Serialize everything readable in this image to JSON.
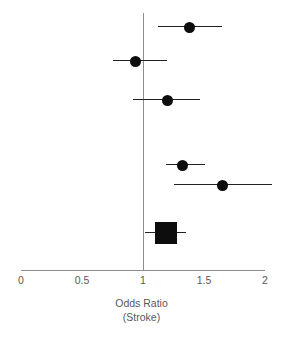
{
  "chart_data": {
    "type": "forest",
    "title": "",
    "xlabel": "Odds Ratio",
    "xlabel_sub": "(Stroke)",
    "ylabel": "",
    "xlim": [
      0,
      2
    ],
    "xticks": [
      0,
      0.5,
      1,
      1.5,
      2
    ],
    "xtick_labels": [
      "0",
      "0.5",
      "1",
      "1.5",
      "2"
    ],
    "null_line": 1,
    "grid": false,
    "legend": "none",
    "marker_color": "#0d0d0d",
    "line_color": "#222222",
    "axis_color": "#8d8d8d",
    "clipped_right": true,
    "studies": [
      {
        "id": "study-1",
        "label": "",
        "estimate": 1.38,
        "ci_low": 1.12,
        "ci_high": 1.65,
        "marker": "circle",
        "marker_size": 11,
        "significant": true
      },
      {
        "id": "study-2",
        "label": "",
        "estimate": 0.94,
        "ci_low": 0.75,
        "ci_high": 1.2,
        "marker": "circle",
        "marker_size": 11,
        "significant": false
      },
      {
        "id": "study-3",
        "label": "",
        "estimate": 1.2,
        "ci_low": 0.92,
        "ci_high": 1.47,
        "marker": "circle",
        "marker_size": 11,
        "significant": false
      },
      {
        "id": "study-4",
        "label": "",
        "estimate": 1.32,
        "ci_low": 1.19,
        "ci_high": 1.51,
        "marker": "circle",
        "marker_size": 11,
        "significant": true
      },
      {
        "id": "study-5",
        "label": "",
        "estimate": 1.65,
        "ci_low": 1.25,
        "ci_high": 2.06,
        "marker": "circle",
        "marker_size": 11,
        "significant": true
      },
      {
        "id": "summary",
        "label": "",
        "estimate": 1.19,
        "ci_low": 1.02,
        "ci_high": 1.35,
        "marker": "square",
        "marker_size": 22,
        "significant": true
      }
    ],
    "row_y": [
      27,
      61,
      100,
      165,
      185,
      233
    ]
  }
}
